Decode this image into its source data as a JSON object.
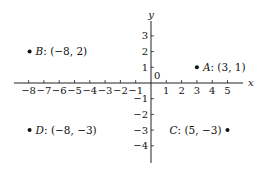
{
  "chart_data": {
    "type": "scatter",
    "title": "",
    "xlabel": "x",
    "ylabel": "y",
    "xlim": [
      -8.5,
      6
    ],
    "ylim": [
      -5,
      4
    ],
    "grid": false,
    "origin_label": "0",
    "x_ticks": [
      -8,
      -7,
      -6,
      -5,
      -4,
      -3,
      -2,
      -1,
      1,
      2,
      3,
      4,
      5
    ],
    "x_tick_labels": [
      "−8",
      "−7",
      "−6",
      "−5",
      "−4",
      "−3",
      "−2",
      "−1",
      "1",
      "2",
      "3",
      "4",
      "5"
    ],
    "y_ticks": [
      3,
      2,
      1,
      -1,
      -2,
      -3,
      -4
    ],
    "y_tick_labels": [
      "3",
      "2",
      "1",
      "−1",
      "−2",
      "−3",
      "−4"
    ],
    "points": [
      {
        "name": "A",
        "x": 3,
        "y": 1,
        "coords": "(3, 1)",
        "label_side": "right"
      },
      {
        "name": "B",
        "x": -8,
        "y": 2,
        "coords": "(−8, 2)",
        "label_side": "right"
      },
      {
        "name": "C",
        "x": 5,
        "y": -3,
        "coords": "(5, −3)",
        "label_side": "left"
      },
      {
        "name": "D",
        "x": -8,
        "y": -3,
        "coords": "(−8, −3)",
        "label_side": "right"
      }
    ]
  }
}
